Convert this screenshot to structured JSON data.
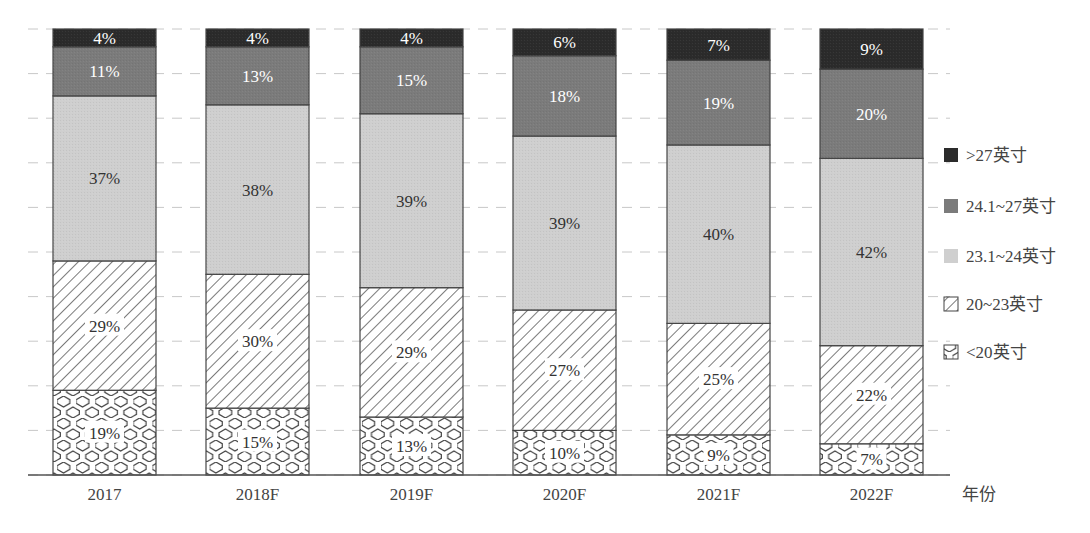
{
  "chart_data": {
    "type": "bar",
    "stacked": true,
    "normalized": true,
    "title": "",
    "xlabel": "年份",
    "ylabel": "",
    "ylim": [
      0,
      100
    ],
    "grid": true,
    "legend_position": "right",
    "categories": [
      "2017",
      "2018F",
      "2019F",
      "2020F",
      "2021F",
      "2022F"
    ],
    "series": [
      {
        "name": "<20英寸",
        "values": [
          19,
          15,
          13,
          10,
          9,
          7
        ],
        "fill": "hexagon-pattern"
      },
      {
        "name": "20~23英寸",
        "values": [
          29,
          30,
          29,
          27,
          25,
          22
        ],
        "fill": "diagonal-hatch"
      },
      {
        "name": "23.1~24英寸",
        "values": [
          37,
          38,
          39,
          39,
          40,
          42
        ],
        "fill": "#cfcfcf"
      },
      {
        "name": "24.1~27英寸",
        "values": [
          11,
          13,
          15,
          18,
          19,
          20
        ],
        "fill": "#7b7b7b"
      },
      {
        "name": ">27英寸",
        "values": [
          4,
          4,
          4,
          6,
          7,
          9
        ],
        "fill": "#2b2b2b"
      }
    ],
    "legend_order": [
      ">27英寸",
      "24.1~27英寸",
      "23.1~24英寸",
      "20~23英寸",
      "<20英寸"
    ]
  },
  "colors": {
    "gt27": "#2b2b2b",
    "r24_27": "#7b7b7b",
    "r23_24": "#cfcfcf",
    "hatch_line": "#333333",
    "hex_line": "#444444",
    "grid": "#c8c8c8",
    "axis": "#555555"
  }
}
